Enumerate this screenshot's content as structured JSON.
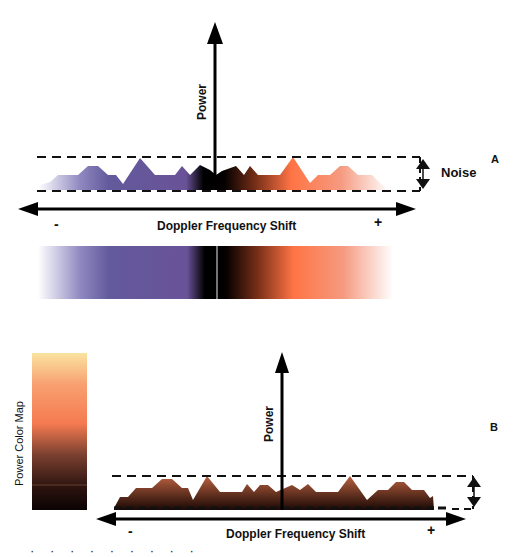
{
  "panel_a": {
    "label": "A",
    "y_axis_label": "Power",
    "x_axis_label": "Doppler Frequency Shift",
    "x_minus": "-",
    "x_plus": "+",
    "noise_label": "Noise",
    "colors": {
      "negative": "#6a5a9e",
      "center": "#000000",
      "positive": "#ff7a50"
    },
    "color_bar": {
      "stops": [
        {
          "pos": 0.0,
          "color": "#ffffff"
        },
        {
          "pos": 0.12,
          "color": "#8f88c0"
        },
        {
          "pos": 0.2,
          "color": "#625a9c"
        },
        {
          "pos": 0.42,
          "color": "#6a5298"
        },
        {
          "pos": 0.47,
          "color": "#000000"
        },
        {
          "pos": 0.5,
          "color": "#000000"
        },
        {
          "pos": 0.53,
          "color": "#050000"
        },
        {
          "pos": 0.62,
          "color": "#7a3018"
        },
        {
          "pos": 0.72,
          "color": "#ff7445"
        },
        {
          "pos": 0.86,
          "color": "#f59a80"
        },
        {
          "pos": 1.0,
          "color": "#ffffff"
        }
      ]
    }
  },
  "panel_b": {
    "label": "B",
    "y_axis_label": "Power",
    "x_axis_label": "Doppler Frequency Shift",
    "x_minus": "-",
    "x_plus": "+",
    "color_map_label": "Power Color Map",
    "colors": {
      "fill_top": "#b86040",
      "fill_bottom": "#1a0804"
    },
    "color_map": {
      "stops": [
        {
          "pos": 0.0,
          "color": "#fae3a0"
        },
        {
          "pos": 0.2,
          "color": "#f8a070"
        },
        {
          "pos": 0.45,
          "color": "#f57a50"
        },
        {
          "pos": 0.65,
          "color": "#7a4030"
        },
        {
          "pos": 0.85,
          "color": "#2e1410"
        },
        {
          "pos": 1.0,
          "color": "#0a0303"
        }
      ]
    }
  },
  "caption_fragment": "· · ·   ·   ·   ·   ·   ·   ·"
}
